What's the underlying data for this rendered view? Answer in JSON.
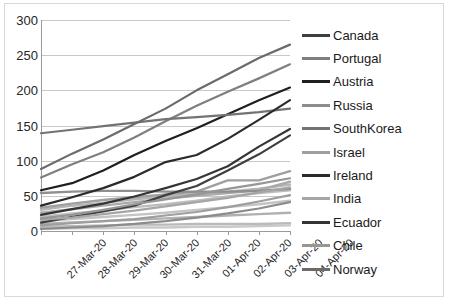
{
  "chart_data": {
    "type": "line",
    "title": "",
    "xlabel": "",
    "ylabel": "",
    "ylim": [
      0,
      300
    ],
    "yticks": [
      0,
      50,
      100,
      150,
      200,
      250,
      300
    ],
    "grid": true,
    "legend_position": "right",
    "categories": [
      "27-Mar-20",
      "28-Mar-20",
      "29-Mar-20",
      "30-Mar-20",
      "31-Mar-20",
      "01-Apr-20",
      "02-Apr-20",
      "03-Apr-20",
      "04-Apr-20"
    ],
    "series": [
      {
        "name": "Canada",
        "color": "#3f3f3f",
        "values": [
          12,
          20,
          28,
          36,
          51,
          64,
          86,
          109,
          136
        ]
      },
      {
        "name": "Portugal",
        "color": "#7f7f7f",
        "values": [
          76,
          95,
          112,
          133,
          156,
          178,
          198,
          217,
          237
        ]
      },
      {
        "name": "Austria",
        "color": "#1f1f1f",
        "values": [
          58,
          68,
          86,
          108,
          128,
          146,
          166,
          186,
          204
        ]
      },
      {
        "name": "Russia",
        "color": "#8c8c8c",
        "values": [
          3,
          5,
          7,
          10,
          14,
          19,
          25,
          32,
          41
        ]
      },
      {
        "name": "SouthKorea",
        "color": "#737373",
        "values": [
          139,
          144,
          149,
          154,
          159,
          162,
          165,
          169,
          174
        ]
      },
      {
        "name": "Israel",
        "color": "#9e9e9e",
        "values": [
          8,
          11,
          14,
          17,
          22,
          27,
          34,
          42,
          51
        ]
      },
      {
        "name": "Ireland",
        "color": "#2b2b2b",
        "values": [
          36,
          48,
          61,
          77,
          98,
          108,
          131,
          158,
          186
        ]
      },
      {
        "name": "India",
        "color": "#a6a6a6",
        "values": [
          16,
          19,
          24,
          29,
          35,
          41,
          47,
          55,
          62
        ]
      },
      {
        "name": "Ecuador",
        "color": "#353535",
        "values": [
          23,
          31,
          39,
          49,
          61,
          74,
          92,
          120,
          145
        ]
      },
      {
        "name": "Chile",
        "color": "#969696",
        "values": [
          18,
          23,
          30,
          38,
          45,
          52,
          60,
          67,
          75
        ]
      },
      {
        "name": "Norway",
        "color": "#6b6b6b",
        "values": [
          88,
          110,
          130,
          152,
          174,
          200,
          223,
          246,
          265
        ]
      }
    ],
    "extra_series": [
      {
        "name": "band-a",
        "color": "#b5b5b5",
        "values": [
          30,
          36,
          40,
          45,
          49,
          53,
          56,
          60,
          66
        ]
      },
      {
        "name": "band-b",
        "color": "#aaaaaa",
        "values": [
          26,
          31,
          36,
          41,
          46,
          50,
          54,
          58,
          70
        ]
      },
      {
        "name": "band-c",
        "color": "#bdbdbd",
        "values": [
          20,
          25,
          29,
          34,
          38,
          43,
          49,
          54,
          58
        ]
      },
      {
        "name": "band-d",
        "color": "#c4c4c4",
        "values": [
          14,
          17,
          20,
          23,
          26,
          30,
          34,
          38,
          43
        ]
      },
      {
        "name": "band-e",
        "color": "#b0b0b0",
        "values": [
          10,
          12,
          14,
          16,
          18,
          20,
          22,
          24,
          26
        ]
      },
      {
        "name": "band-f",
        "color": "#bababa",
        "values": [
          6,
          7,
          8,
          9,
          9,
          10,
          10,
          10,
          11
        ]
      },
      {
        "name": "band-g",
        "color": "#c9c9c9",
        "values": [
          3,
          4,
          4,
          5,
          5,
          6,
          6,
          7,
          8
        ]
      },
      {
        "name": "band-h",
        "color": "#9f9f9f",
        "values": [
          33,
          39,
          44,
          48,
          52,
          56,
          72,
          72,
          85
        ]
      },
      {
        "name": "band-i",
        "color": "#8f8f8f",
        "values": [
          54,
          56,
          57,
          57,
          56,
          56,
          56,
          57,
          60
        ]
      }
    ]
  }
}
